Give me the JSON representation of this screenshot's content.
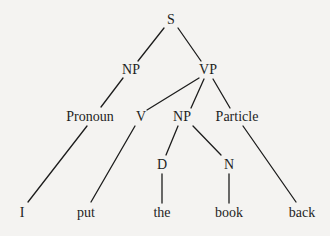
{
  "diagram": {
    "type": "syntax-tree",
    "nodes": [
      {
        "id": "S",
        "label": "S",
        "x": 171,
        "y": 20
      },
      {
        "id": "NP1",
        "label": "NP",
        "x": 131,
        "y": 70
      },
      {
        "id": "VP",
        "label": "VP",
        "x": 208,
        "y": 70
      },
      {
        "id": "Pronoun",
        "label": "Pronoun",
        "x": 90,
        "y": 117
      },
      {
        "id": "V",
        "label": "V",
        "x": 141,
        "y": 117
      },
      {
        "id": "NP2",
        "label": "NP",
        "x": 182,
        "y": 117
      },
      {
        "id": "Particle",
        "label": "Particle",
        "x": 237,
        "y": 117
      },
      {
        "id": "D",
        "label": "D",
        "x": 162,
        "y": 165
      },
      {
        "id": "N",
        "label": "N",
        "x": 229,
        "y": 165
      },
      {
        "id": "w_I",
        "label": "I",
        "x": 22,
        "y": 213
      },
      {
        "id": "w_put",
        "label": "put",
        "x": 86,
        "y": 213
      },
      {
        "id": "w_the",
        "label": "the",
        "x": 162,
        "y": 213
      },
      {
        "id": "w_book",
        "label": "book",
        "x": 229,
        "y": 213
      },
      {
        "id": "w_back",
        "label": "back",
        "x": 302,
        "y": 213
      }
    ],
    "edges": [
      {
        "from": "S",
        "to": "NP1",
        "x1": 164,
        "y1": 28,
        "x2": 138,
        "y2": 61
      },
      {
        "from": "S",
        "to": "VP",
        "x1": 178,
        "y1": 28,
        "x2": 201,
        "y2": 61
      },
      {
        "from": "NP1",
        "to": "Pronoun",
        "x1": 123,
        "y1": 78,
        "x2": 101,
        "y2": 107
      },
      {
        "from": "VP",
        "to": "V",
        "x1": 199,
        "y1": 78,
        "x2": 147,
        "y2": 110
      },
      {
        "from": "VP",
        "to": "NP2",
        "x1": 204,
        "y1": 79,
        "x2": 191,
        "y2": 108
      },
      {
        "from": "VP",
        "to": "Particle",
        "x1": 213,
        "y1": 79,
        "x2": 230,
        "y2": 108
      },
      {
        "from": "Pronoun",
        "to": "w_I",
        "x1": 87,
        "y1": 126,
        "x2": 28,
        "y2": 202
      },
      {
        "from": "V",
        "to": "w_put",
        "x1": 135,
        "y1": 126,
        "x2": 91,
        "y2": 202
      },
      {
        "from": "NP2",
        "to": "D",
        "x1": 178,
        "y1": 126,
        "x2": 166,
        "y2": 155
      },
      {
        "from": "NP2",
        "to": "N",
        "x1": 193,
        "y1": 126,
        "x2": 221,
        "y2": 155
      },
      {
        "from": "D",
        "to": "w_the",
        "x1": 162,
        "y1": 174,
        "x2": 162,
        "y2": 203
      },
      {
        "from": "N",
        "to": "w_book",
        "x1": 229,
        "y1": 174,
        "x2": 229,
        "y2": 203
      },
      {
        "from": "Particle",
        "to": "w_back",
        "x1": 243,
        "y1": 126,
        "x2": 296,
        "y2": 202
      }
    ]
  },
  "labels": {
    "S": "S",
    "NP1": "NP",
    "VP": "VP",
    "Pronoun": "Pronoun",
    "V": "V",
    "NP2": "NP",
    "Particle": "Particle",
    "D": "D",
    "N": "N",
    "w_I": "I",
    "w_put": "put",
    "w_the": "the",
    "w_book": "book",
    "w_back": "back"
  },
  "colors": {
    "background": "#f4f3f1",
    "ink": "#1c1c1c"
  }
}
